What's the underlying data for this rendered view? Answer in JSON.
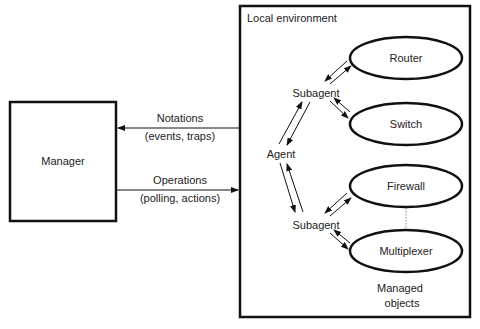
{
  "diagram": {
    "manager": {
      "label": "Manager"
    },
    "local_environment": {
      "label": "Local environment"
    },
    "notations": {
      "line1": "Notations",
      "line2": "(events, traps)"
    },
    "operations": {
      "line1": "Operations",
      "line2": "(polling, actions)"
    },
    "agent": {
      "label": "Agent"
    },
    "subagents": [
      {
        "label": "Subagent"
      },
      {
        "label": "Subagent"
      }
    ],
    "managed_objects": [
      {
        "label": "Router"
      },
      {
        "label": "Switch"
      },
      {
        "label": "Firewall"
      },
      {
        "label": "Multiplexer"
      }
    ],
    "managed_objects_caption": {
      "line1": "Managed",
      "line2": "objects"
    }
  },
  "colors": {
    "stroke": "#111111",
    "text": "#222222",
    "dotted": "#888888"
  }
}
